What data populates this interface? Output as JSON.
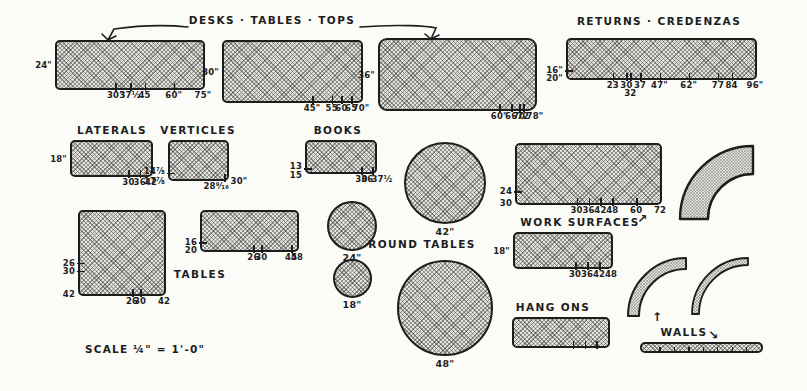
{
  "colors": {
    "ink": "#1d1d1d",
    "paper": "#fbfbf8",
    "fill": "#e2e2de"
  },
  "icons": {
    "up_right_arrow": "↗",
    "up_arrow": "↑",
    "down_right_arrow": "↘"
  },
  "scale_note": "SCALE  ¼\" = 1'-0\"",
  "sections": {
    "desks": {
      "title": "DESKS · TABLES · TOPS"
    },
    "returns": {
      "title": "RETURNS · CREDENZAS"
    },
    "laterals": {
      "title": "LATERALS"
    },
    "verticles": {
      "title": "VERTICLES"
    },
    "books": {
      "title": "BOOKS"
    },
    "tables": {
      "title": "TABLES"
    },
    "round_tables": {
      "title": "ROUND TABLES"
    },
    "work_surfaces": {
      "title": "WORK SURFACES"
    },
    "hang_ons": {
      "title": "HANG ONS"
    },
    "walls": {
      "title": "WALLS"
    }
  },
  "shapes": {
    "desk1": {
      "left": [
        {
          "t": "24\"",
          "v": 24
        }
      ],
      "bottom": [
        {
          "t": "30\"",
          "v": 30
        },
        {
          "t": "37½",
          "v": 37.5
        },
        {
          "t": "45",
          "v": 45
        },
        {
          "t": "60\"",
          "v": 60
        },
        {
          "t": "75\"",
          "v": 75
        }
      ]
    },
    "desk2": {
      "left": [
        {
          "t": "30\"",
          "v": 30
        }
      ],
      "bottom": [
        {
          "t": "45\"",
          "v": 45
        },
        {
          "t": "55",
          "v": 55
        },
        {
          "t": "60",
          "v": 60
        },
        {
          "t": "65",
          "v": 65
        },
        {
          "t": "70\"",
          "v": 70
        }
      ]
    },
    "desk3": {
      "left": [
        {
          "t": "36\"",
          "v": 36
        }
      ],
      "bottom": [
        {
          "t": "60\"",
          "v": 60
        },
        {
          "t": "66",
          "v": 66
        },
        {
          "t": "70",
          "v": 70
        },
        {
          "t": "72",
          "v": 72
        },
        {
          "t": "78\"",
          "v": 78
        }
      ]
    },
    "returns": {
      "left": [
        {
          "t": "16\"",
          "v": 16
        },
        {
          "t": "20\"",
          "v": 20
        }
      ],
      "bottom": [
        {
          "t": "23",
          "v": 23
        },
        {
          "t": "30",
          "v": 30
        },
        {
          "t": "32",
          "v": 32,
          "low": true
        },
        {
          "t": "37",
          "v": 37
        },
        {
          "t": "47\"",
          "v": 47
        },
        {
          "t": "62\"",
          "v": 62
        },
        {
          "t": "77",
          "v": 77
        },
        {
          "t": "84",
          "v": 84
        },
        {
          "t": "96\"",
          "v": 96
        }
      ]
    },
    "laterals": {
      "left": [
        {
          "t": "18\"",
          "v": 18
        }
      ],
      "bottom": [
        {
          "t": "30",
          "v": 30
        },
        {
          "t": "36",
          "v": 36
        },
        {
          "t": "42",
          "v": 42
        }
      ]
    },
    "verticles": {
      "left": [
        {
          "t": "14⅞",
          "v": 14.875,
          "dy": -2
        },
        {
          "t": "17⅞",
          "v": 17.875,
          "dy": 2
        }
      ],
      "bottom": [
        {
          "t": "28⁹⁄₁₆",
          "v": 28.56,
          "dx": -8
        },
        {
          "t": "30\"",
          "v": 30,
          "dx": 12,
          "dy": -5
        }
      ]
    },
    "books": {
      "left": [
        {
          "t": "13",
          "v": 13,
          "dy": -2
        },
        {
          "t": "15",
          "v": 15,
          "dy": 3
        }
      ],
      "bottom": [
        {
          "t": "30",
          "v": 30
        },
        {
          "t": "36",
          "v": 36,
          "dx": -5
        },
        {
          "t": "37½",
          "v": 37.5,
          "dx": 7
        }
      ]
    },
    "tables_sq": {
      "left": [
        {
          "t": "26",
          "v": 26
        },
        {
          "t": "30",
          "v": 30
        },
        {
          "t": "42",
          "v": 42
        }
      ],
      "bottom": [
        {
          "t": "26",
          "v": 26
        },
        {
          "t": "30",
          "v": 30
        },
        {
          "t": "42",
          "v": 42
        }
      ]
    },
    "tables_r": {
      "left": [
        {
          "t": "16",
          "v": 16
        },
        {
          "t": "20",
          "v": 20
        }
      ],
      "bottom": [
        {
          "t": "26",
          "v": 26
        },
        {
          "t": "30",
          "v": 30
        },
        {
          "t": "45",
          "v": 45
        },
        {
          "t": "48",
          "v": 48
        }
      ]
    },
    "work1": {
      "left": [
        {
          "t": "24",
          "v": 24
        },
        {
          "t": "30",
          "v": 30
        }
      ],
      "bottom": [
        {
          "t": "30",
          "v": 30
        },
        {
          "t": "36",
          "v": 36
        },
        {
          "t": "42",
          "v": 42
        },
        {
          "t": "48",
          "v": 48
        },
        {
          "t": "60",
          "v": 60
        },
        {
          "t": "72",
          "v": 72
        }
      ]
    },
    "work2": {
      "left": [
        {
          "t": "18\"",
          "v": 18
        }
      ],
      "bottom": [
        {
          "t": "30",
          "v": 30
        },
        {
          "t": "36",
          "v": 36
        },
        {
          "t": "42",
          "v": 42
        },
        {
          "t": "48",
          "v": 48
        }
      ]
    },
    "hangons": {
      "wmax": 48,
      "left": [],
      "bottom": [
        {
          "t": "",
          "v": 30
        },
        {
          "t": "",
          "v": 36
        },
        {
          "t": "",
          "v": 42
        }
      ]
    },
    "circles": {
      "c42": {
        "label": "42\""
      },
      "c24": {
        "label": "24\""
      },
      "c18": {
        "label": "18\""
      },
      "c48": {
        "label": "48\""
      }
    }
  }
}
